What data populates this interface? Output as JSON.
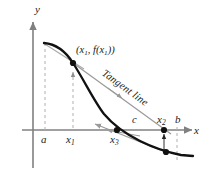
{
  "figure": {
    "axes": {
      "y_label": "y",
      "x_label": "x"
    },
    "tick_labels": {
      "a": "a",
      "x1": "x",
      "x1_sub": "1",
      "x3": "x",
      "x3_sub": "3",
      "x2": "x",
      "x2_sub": "2",
      "b": "b",
      "c": "c"
    },
    "annotations": {
      "point_label_open": "(",
      "point_label_x1": "x",
      "point_label_x1_sub": "1",
      "point_label_comma": ", ",
      "point_label_f": "f",
      "point_label_inner_open": "(",
      "point_label_inner_x1": "x",
      "point_label_inner_x1_sub": "1",
      "point_label_close": "))",
      "tangent_line": "Tangent line"
    },
    "colors": {
      "curve": "#111111",
      "axis": "#808080",
      "tangent": "#999999",
      "dashed": "#aaaaaa",
      "dot": "#111111",
      "text": "#1a1a1a",
      "background": "#ffffff"
    },
    "geometry": {
      "x_axis_y": 130,
      "y_axis_x": 33,
      "a_x": 45,
      "x1_x": 73,
      "x3_x": 117,
      "c_x": 135,
      "x2_x": 164,
      "b_x": 177,
      "point_x1_y": 63,
      "point_x2_curve_y": 151
    }
  }
}
